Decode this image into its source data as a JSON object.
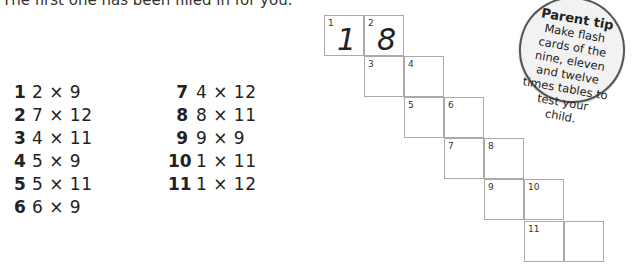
{
  "instruction": "The first one has been filled in for you.",
  "questions_left": [
    {
      "num": "1",
      "expr": "2 × 9"
    },
    {
      "num": "2",
      "expr": "7 × 12"
    },
    {
      "num": "3",
      "expr": "4 × 11"
    },
    {
      "num": "4",
      "expr": "5 × 9"
    },
    {
      "num": "5",
      "expr": "5 × 11"
    },
    {
      "num": "6",
      "expr": "6 × 9"
    }
  ],
  "questions_right": [
    {
      "num": "7",
      "expr": "4 × 12"
    },
    {
      "num": "8",
      "expr": "8 × 11"
    },
    {
      "num": "9",
      "expr": "9 × 9"
    },
    {
      "num": "10",
      "expr": "1 × 11"
    },
    {
      "num": "11",
      "expr": "1 × 12"
    }
  ],
  "grid": {
    "cells": [
      {
        "label": "1",
        "value": "1"
      },
      {
        "label": "2",
        "value": "8"
      },
      {
        "label": "3",
        "value": ""
      },
      {
        "label": "4",
        "value": ""
      },
      {
        "label": "5",
        "value": ""
      },
      {
        "label": "6",
        "value": ""
      },
      {
        "label": "7",
        "value": ""
      },
      {
        "label": "8",
        "value": ""
      },
      {
        "label": "9",
        "value": ""
      },
      {
        "label": "10",
        "value": ""
      },
      {
        "label": "11",
        "value": ""
      },
      {
        "label": "",
        "value": ""
      }
    ]
  },
  "tip": {
    "title": "Parent tip",
    "body": "Make flash cards of the nine, eleven and twelve times tables to test your child."
  }
}
